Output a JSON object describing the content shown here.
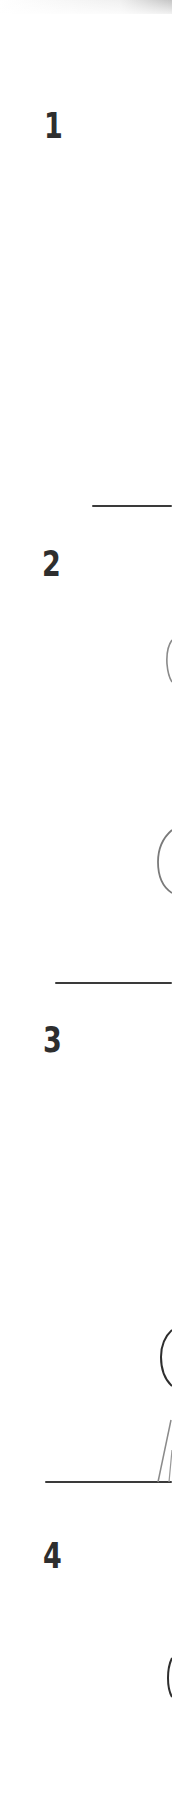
{
  "document": {
    "type": "scanned-worksheet-strip",
    "colors": {
      "background": "#ffffff",
      "ink": "#2e2e2e",
      "pencil": "#777777"
    }
  },
  "problems": [
    {
      "number": "1",
      "label_y": 110
    },
    {
      "number": "2",
      "label_y": 548
    },
    {
      "number": "3",
      "label_y": 1023
    },
    {
      "number": "4",
      "label_y": 1536
    }
  ],
  "dividers": [
    {
      "y": 505,
      "x_start": 92,
      "x_end": 172
    },
    {
      "y": 982,
      "x_start": 55,
      "x_end": 172
    },
    {
      "y": 1482,
      "x_start": 45,
      "x_end": 172
    }
  ],
  "sketches": [
    {
      "shape": "circle-arc-fragment",
      "section": "2",
      "y": 660
    },
    {
      "shape": "circle-arc-fragment",
      "section": "2",
      "y": 860
    },
    {
      "shape": "circle-arc-fragment",
      "section": "3",
      "y": 1355
    },
    {
      "shape": "slanted-line",
      "section": "3",
      "y_from": 1420,
      "y_to": 1482
    },
    {
      "shape": "circle-arc-fragment",
      "section": "4",
      "y": 1678
    }
  ]
}
